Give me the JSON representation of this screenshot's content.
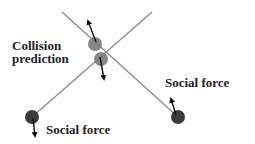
{
  "diagram": {
    "labels": {
      "collision_line1": "Collision",
      "collision_line2": "prediction",
      "social_force_right": "Social force",
      "social_force_left": "Social force"
    },
    "colors": {
      "trajectory_line": "#8a8a8a",
      "predicted_agent": "#7a7a7a",
      "agent": "#3a3a3a",
      "arrow": "#111111",
      "text": "#222222"
    },
    "elements": {
      "trajectory_1": {
        "from": [
          62,
          12
        ],
        "to": [
          178,
          117
        ]
      },
      "trajectory_2": {
        "from": [
          152,
          12
        ],
        "to": [
          32,
          117
        ]
      },
      "predicted_agent_upper": {
        "center": [
          95,
          44
        ],
        "radius": 7,
        "arrow_to": [
          88,
          20
        ]
      },
      "predicted_agent_lower": {
        "center": [
          101,
          59
        ],
        "radius": 7,
        "arrow_to": [
          104,
          80
        ]
      },
      "agent_left": {
        "center": [
          32,
          117
        ],
        "radius": 7,
        "arrow_to": [
          35,
          137
        ]
      },
      "agent_right": {
        "center": [
          178,
          117
        ],
        "radius": 7,
        "arrow_to": [
          171,
          98
        ]
      }
    }
  }
}
